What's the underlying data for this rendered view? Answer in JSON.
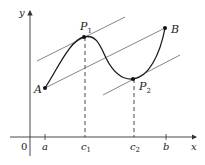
{
  "diagram": {
    "axes": {
      "x_label": "x",
      "y_label": "y",
      "origin_label": "0",
      "x_ticks": [
        {
          "label": "a",
          "sub": ""
        },
        {
          "label": "c",
          "sub": "1"
        },
        {
          "label": "c",
          "sub": "2"
        },
        {
          "label": "b",
          "sub": ""
        }
      ]
    },
    "points": {
      "A": {
        "label": "A",
        "sub": ""
      },
      "B": {
        "label": "B",
        "sub": ""
      },
      "P1": {
        "label": "P",
        "sub": "1"
      },
      "P2": {
        "label": "P",
        "sub": "2"
      }
    },
    "lines": [
      {
        "name": "secant-AB",
        "description": "Secant line through A and B"
      },
      {
        "name": "tangent-P1",
        "description": "Tangent at P1 parallel to AB"
      },
      {
        "name": "tangent-P2",
        "description": "Tangent at P2 parallel to AB"
      }
    ],
    "colors": {
      "curve": "#1a1a1a",
      "lines": "#555555",
      "axes": "#333333"
    }
  }
}
